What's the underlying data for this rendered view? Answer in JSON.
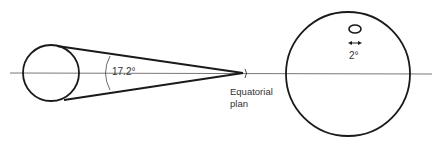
{
  "diagram": {
    "angle_label": "17.2°",
    "plane_label_line1": "Equatorial",
    "plane_label_line2": "plan",
    "small_angle_label": "2°",
    "colors": {
      "stroke": "#1a1a1a",
      "axis": "#555555",
      "text": "#333333",
      "background": "#ffffff"
    }
  }
}
